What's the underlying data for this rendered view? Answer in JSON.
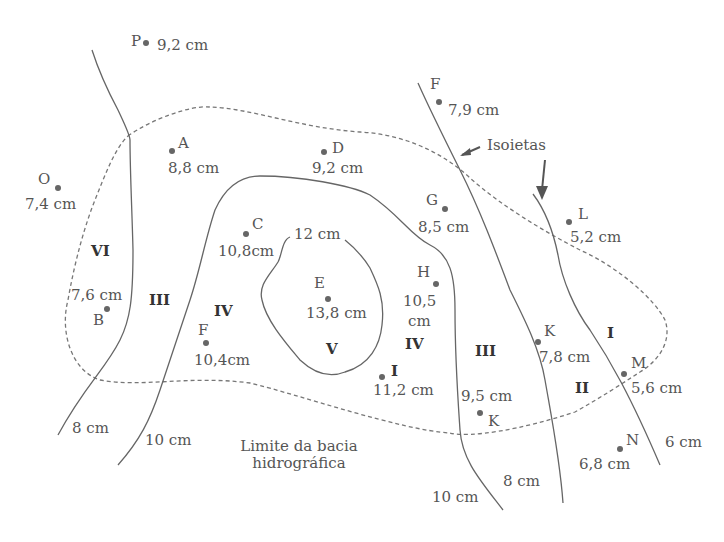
{
  "diagram": {
    "annotations": {
      "isoietas_label": "Isoietas",
      "basin_label_line1": "Limite da bacia",
      "basin_label_line2": "hidrográfica"
    },
    "isohyets": [
      {
        "id": "iso-8cm-left",
        "label": "8 cm"
      },
      {
        "id": "iso-10cm-left",
        "label": "10 cm"
      },
      {
        "id": "iso-12cm",
        "label": "12 cm"
      },
      {
        "id": "iso-10cm-right",
        "label": "10 cm"
      },
      {
        "id": "iso-8cm-right",
        "label": "8 cm"
      },
      {
        "id": "iso-6cm",
        "label": "6 cm"
      }
    ],
    "stations": [
      {
        "name": "P",
        "value": "9,2 cm"
      },
      {
        "name": "A",
        "value": "8,8 cm"
      },
      {
        "name": "D",
        "value": "9,2 cm"
      },
      {
        "name": "O",
        "value": "7,4 cm"
      },
      {
        "name": "C",
        "value": "10,8cm"
      },
      {
        "name": "E",
        "value": "13,8 cm"
      },
      {
        "name": "B",
        "value": "7,6 cm"
      },
      {
        "name": "F",
        "value": "10,4cm"
      },
      {
        "name": "F",
        "value": "7,9 cm"
      },
      {
        "name": "G",
        "value": "8,5 cm"
      },
      {
        "name": "L",
        "value": "5,2 cm"
      },
      {
        "name": "H",
        "value_line1": "10,5",
        "value_line2": "cm"
      },
      {
        "name": "I",
        "value": "11,2 cm"
      },
      {
        "name": "J",
        "value": "9,5 cm"
      },
      {
        "name": "K",
        "value": "7,8 cm"
      },
      {
        "name": "M",
        "value": "5,6 cm"
      },
      {
        "name": "N",
        "value": "6,8 cm"
      }
    ],
    "zones": [
      "VI",
      "III",
      "IV",
      "V",
      "IV",
      "III",
      "II",
      "I"
    ]
  }
}
